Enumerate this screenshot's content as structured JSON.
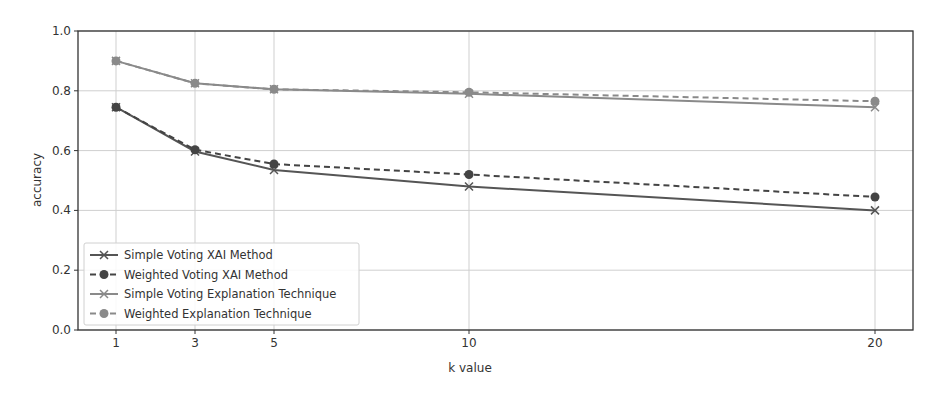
{
  "chart_data": {
    "type": "line",
    "title": "",
    "xlabel": "k value",
    "ylabel": "accuracy",
    "x": [
      1,
      3,
      5,
      10,
      20
    ],
    "xticks": [
      "1",
      "3",
      "5",
      "10",
      "20"
    ],
    "yticks": [
      "0.0",
      "0.2",
      "0.4",
      "0.6",
      "0.8",
      "1.0"
    ],
    "ylim": [
      0.0,
      1.0
    ],
    "xlim": [
      0,
      21.5
    ],
    "grid": true,
    "legend_position": "lower left",
    "series": [
      {
        "name": "Simple Voting XAI Method",
        "values": [
          0.745,
          0.597,
          0.535,
          0.48,
          0.4
        ],
        "color": "#555555",
        "linestyle": "solid",
        "marker": "x"
      },
      {
        "name": "Weighted Voting XAI Method",
        "values": [
          0.745,
          0.603,
          0.555,
          0.52,
          0.445
        ],
        "color": "#444444",
        "linestyle": "dashed",
        "marker": "o"
      },
      {
        "name": "Simple Voting Explanation Technique",
        "values": [
          0.9,
          0.825,
          0.805,
          0.79,
          0.745
        ],
        "color": "#8a8a8a",
        "linestyle": "solid",
        "marker": "x"
      },
      {
        "name": "Weighted Explanation Technique",
        "values": [
          0.9,
          0.825,
          0.805,
          0.795,
          0.765
        ],
        "color": "#8a8a8a",
        "linestyle": "dashed",
        "marker": "o"
      }
    ]
  }
}
